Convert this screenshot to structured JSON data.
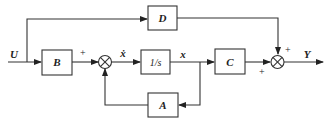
{
  "diagram": {
    "type": "state-space block diagram",
    "signals": {
      "input": "U",
      "output": "Y",
      "state_derivative": "ẋ",
      "state": "x"
    },
    "blocks": {
      "B": "B",
      "integrator": "1/s",
      "C": "C",
      "A": "A",
      "D": "D"
    },
    "summers": {
      "sum1_sign_input": "+",
      "sum2_sign_top": "+",
      "sum2_sign_left": "+"
    },
    "colors": {
      "line": "#333333",
      "background": "#ffffff"
    }
  }
}
